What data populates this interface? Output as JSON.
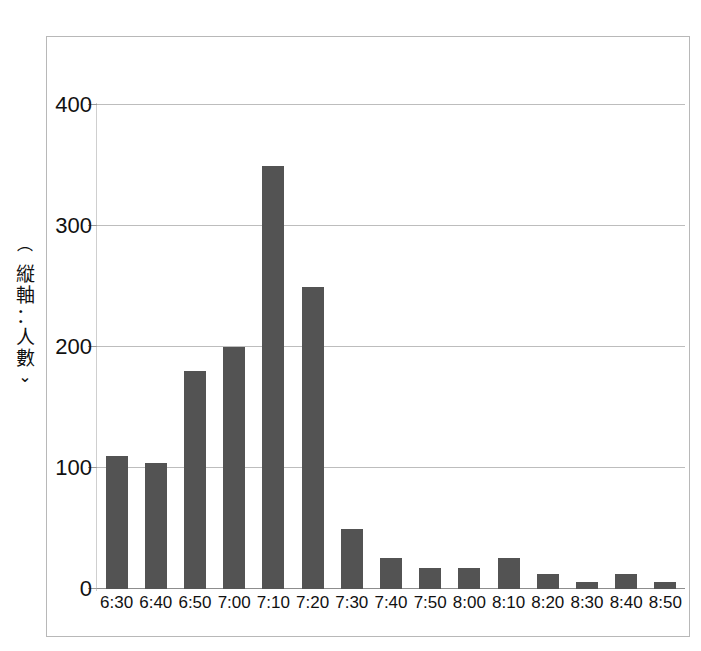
{
  "chart_data": {
    "type": "bar",
    "title": "",
    "subtitle": "",
    "xlabel": "",
    "ylabel": "（縦軸：人數）",
    "ylim": [
      0,
      420
    ],
    "yticks": [
      0,
      100,
      200,
      300,
      400
    ],
    "ytick_labels": [
      "0",
      "100",
      "200",
      "300",
      "400"
    ],
    "grid": true,
    "legend": false,
    "legend_position": "none",
    "bar_color": "#535353",
    "gridline_color": "#bdbdbd",
    "frame_color": "#b8b8b8",
    "categories": [
      "6:30",
      "6:40",
      "6:50",
      "7:00",
      "7:10",
      "7:20",
      "7:30",
      "7:40",
      "7:50",
      "8:00",
      "8:10",
      "8:20",
      "8:30",
      "8:40",
      "8:50"
    ],
    "values": [
      110,
      104,
      180,
      200,
      350,
      250,
      50,
      26,
      17,
      17,
      26,
      12,
      6,
      12,
      6
    ],
    "series": [
      {
        "name": "人數",
        "values": [
          110,
          104,
          180,
          200,
          350,
          250,
          50,
          26,
          17,
          17,
          26,
          12,
          6,
          12,
          6
        ]
      }
    ]
  }
}
